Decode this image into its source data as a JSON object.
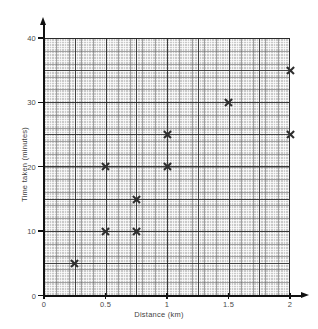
{
  "chart_data": {
    "type": "scatter",
    "title": "",
    "xlabel": "Distance (km)",
    "ylabel": "Time taken (minutes)",
    "xlim": [
      0,
      2
    ],
    "ylim": [
      0,
      40
    ],
    "xticks": [
      "0",
      "0.5",
      "1",
      "1.5",
      "2"
    ],
    "xtick_values": [
      0,
      0.5,
      1,
      1.5,
      2
    ],
    "yticks": [
      "0",
      "10",
      "20",
      "30",
      "40"
    ],
    "ytick_values": [
      0,
      10,
      20,
      30,
      40
    ],
    "grid": true,
    "grid_style": "graph-paper",
    "legend": "none",
    "marker": "x",
    "marker_color": "#2e2e2e",
    "points": [
      {
        "x": 0.25,
        "y": 5,
        "label": "(0.25, 5)"
      },
      {
        "x": 0.5,
        "y": 10,
        "label": "(0.5, 10)"
      },
      {
        "x": 0.75,
        "y": 10,
        "label": "(0.75, 10)"
      },
      {
        "x": 0.75,
        "y": 15,
        "label": "(0.75, 15)"
      },
      {
        "x": 0.5,
        "y": 20,
        "label": "(0.5, 20)"
      },
      {
        "x": 1,
        "y": 20,
        "label": "(1, 20)"
      },
      {
        "x": 1,
        "y": 25,
        "label": "(1, 25)"
      },
      {
        "x": 2,
        "y": 25,
        "label": "(2, 25)"
      },
      {
        "x": 1.5,
        "y": 30,
        "label": "(1.5, 30)"
      },
      {
        "x": 2,
        "y": 35,
        "label": "(2, 35)"
      }
    ]
  },
  "colors": {
    "grid_background": "#c9c9c9",
    "grid_major": "#282828",
    "grid_minor": "#ffffff",
    "axis": "#111111",
    "text": "#3f3f3f",
    "page_background": "#ffffff"
  }
}
